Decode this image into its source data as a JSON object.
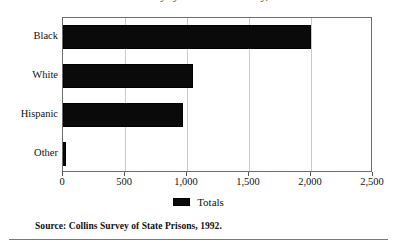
{
  "chart_data": {
    "type": "bar",
    "orientation": "horizontal",
    "title": "Prison Survey by Race and Ethnicity, 1992",
    "xlabel": "",
    "ylabel": "",
    "categories": [
      "Black",
      "White",
      "Hispanic",
      "Other"
    ],
    "series": [
      {
        "name": "Totals",
        "values": [
          2000,
          1050,
          970,
          25
        ],
        "color": "#0a0a0a"
      }
    ],
    "xlim": [
      0,
      2500
    ],
    "xticks": [
      0,
      500,
      1000,
      1500,
      2000,
      2500
    ],
    "xtick_labels": [
      "0",
      "500",
      "1,000",
      "1,500",
      "2,000",
      "2,500"
    ],
    "grid": true,
    "grid_axis": "x",
    "grid_color": "#c9c9c9",
    "legend": {
      "position": "bottom",
      "entries": [
        {
          "label": "Totals",
          "color": "#0a0a0a"
        }
      ]
    },
    "frame_color": "#6d6d6d"
  },
  "source": {
    "text": "Source: Collins Survey of State Prisons, 1992."
  }
}
